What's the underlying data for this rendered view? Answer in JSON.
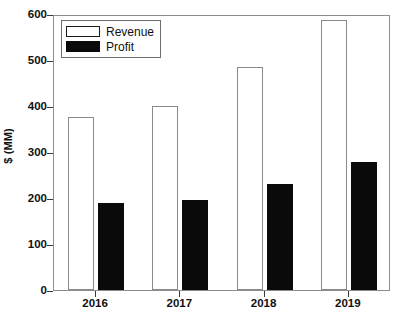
{
  "chart_data": {
    "type": "bar",
    "title": "",
    "xlabel": "",
    "ylabel": "$ (MM)",
    "categories": [
      "2016",
      "2017",
      "2018",
      "2019"
    ],
    "series": [
      {
        "name": "Revenue",
        "values": [
          377,
          400,
          485,
          588
        ],
        "color": "#ffffff",
        "edge_color": "#8a8a8a"
      },
      {
        "name": "Profit",
        "values": [
          190,
          196,
          230,
          278
        ],
        "color": "#0a0a0a",
        "edge_color": "#0a0a0a"
      }
    ],
    "ylim": [
      0,
      600
    ],
    "yticks": [
      0,
      100,
      200,
      300,
      400,
      500,
      600
    ],
    "ytick_labels": [
      "0",
      "100",
      "200",
      "300",
      "400",
      "500",
      "600"
    ],
    "grid": false,
    "legend_position": "upper left",
    "legend_entries": [
      "Revenue",
      "Profit"
    ],
    "frame": true
  },
  "axes": {
    "y_title": "$ (MM)"
  }
}
